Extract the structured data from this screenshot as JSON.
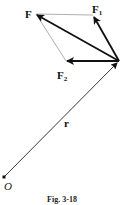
{
  "figure": {
    "caption": "Fig. 3-18",
    "labels": {
      "F": "F",
      "F1_main": "F",
      "F1_sub": "1",
      "F2_main": "F",
      "F2_sub": "2",
      "r": "r",
      "O": "O"
    },
    "points": {
      "origin_O": [
        4,
        177
      ],
      "vertex": [
        119,
        61
      ],
      "F_tip": [
        36,
        14
      ],
      "F1_tip": [
        93,
        15
      ],
      "F2_tip": [
        66,
        61
      ]
    },
    "vectors": [
      {
        "name": "r",
        "from": "origin_O",
        "to": "vertex",
        "style": "thin-arrow"
      },
      {
        "name": "F",
        "from": "vertex",
        "to": "F_tip",
        "style": "bold-arrow"
      },
      {
        "name": "F1",
        "from": "vertex",
        "to": "F1_tip",
        "style": "bold-arrow"
      },
      {
        "name": "F2",
        "from": "vertex",
        "to": "F2_tip",
        "style": "bold-arrow"
      }
    ],
    "construction_lines": [
      {
        "from": "F_tip",
        "to": "F1_tip"
      },
      {
        "from": "F_tip",
        "to": "F2_tip"
      }
    ],
    "colors": {
      "ink": "#111111",
      "construction": "#999999",
      "background": "#ffffff"
    }
  }
}
